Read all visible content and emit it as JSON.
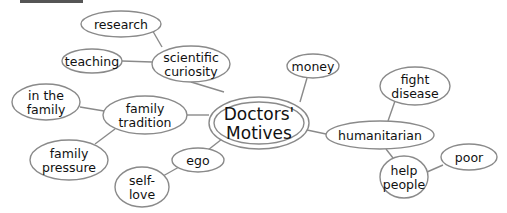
{
  "diagram": {
    "type": "mind-map",
    "center": {
      "id": "center",
      "lines": [
        "Doctors'",
        "Motives"
      ],
      "cx": 259,
      "cy": 123,
      "rx": 50,
      "ry": 26,
      "inner_rx": 45,
      "inner_ry": 21
    },
    "nodes": [
      {
        "id": "scientific",
        "lines": [
          "scientific",
          "curiosity"
        ],
        "cx": 191,
        "cy": 64,
        "rx": 39,
        "ry": 18
      },
      {
        "id": "research",
        "lines": [
          "research"
        ],
        "cx": 121,
        "cy": 24,
        "rx": 40,
        "ry": 13
      },
      {
        "id": "teaching",
        "lines": [
          "teaching"
        ],
        "cx": 92,
        "cy": 61,
        "rx": 30,
        "ry": 12
      },
      {
        "id": "money",
        "lines": [
          "money"
        ],
        "cx": 313,
        "cy": 66,
        "rx": 26,
        "ry": 12
      },
      {
        "id": "tradition",
        "lines": [
          "family",
          "tradition"
        ],
        "cx": 145,
        "cy": 115,
        "rx": 42,
        "ry": 19
      },
      {
        "id": "inthefamily",
        "lines": [
          "in the",
          "family"
        ],
        "cx": 46,
        "cy": 102,
        "rx": 34,
        "ry": 18
      },
      {
        "id": "pressure",
        "lines": [
          "family",
          "pressure"
        ],
        "cx": 69,
        "cy": 160,
        "rx": 39,
        "ry": 20
      },
      {
        "id": "ego",
        "lines": [
          "ego"
        ],
        "cx": 198,
        "cy": 160,
        "rx": 26,
        "ry": 12
      },
      {
        "id": "selflove",
        "lines": [
          "self-",
          "love"
        ],
        "cx": 142,
        "cy": 187,
        "rx": 27,
        "ry": 20
      },
      {
        "id": "humanitarian",
        "lines": [
          "humanitarian"
        ],
        "cx": 380,
        "cy": 135,
        "rx": 54,
        "ry": 14
      },
      {
        "id": "fight",
        "lines": [
          "fight",
          "disease"
        ],
        "cx": 415,
        "cy": 86,
        "rx": 35,
        "ry": 19
      },
      {
        "id": "help",
        "lines": [
          "help",
          "people"
        ],
        "cx": 404,
        "cy": 177,
        "rx": 24,
        "ry": 21
      },
      {
        "id": "poor",
        "lines": [
          "poor"
        ],
        "cx": 469,
        "cy": 157,
        "rx": 28,
        "ry": 13
      }
    ],
    "edges": [
      [
        224,
        92,
        191,
        82
      ],
      [
        300,
        102,
        307,
        78
      ],
      [
        209,
        115,
        187,
        115
      ],
      [
        222,
        139,
        208,
        150
      ],
      [
        307,
        130,
        326,
        134
      ],
      [
        151,
        28,
        162,
        47
      ],
      [
        122,
        61,
        152,
        62
      ],
      [
        80,
        107,
        104,
        111
      ],
      [
        115,
        129,
        95,
        144
      ],
      [
        179,
        167,
        163,
        176
      ],
      [
        395,
        101,
        388,
        121
      ],
      [
        386,
        149,
        393,
        158
      ],
      [
        427,
        172,
        443,
        165
      ]
    ],
    "colors": {
      "stroke": "#8a8a8a",
      "text": "#111111",
      "background": "#ffffff"
    }
  }
}
